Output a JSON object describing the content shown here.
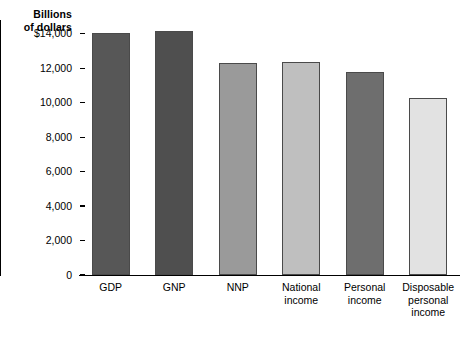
{
  "chart_data": {
    "type": "bar",
    "title": "",
    "subtitle": "",
    "ylabel": "Billions of dollars",
    "xlabel": "",
    "categories": [
      "GDP",
      "GNP",
      "NNP",
      "National income",
      "Personal income",
      "Disposable personal income"
    ],
    "category_lines": [
      [
        "GDP"
      ],
      [
        "GNP"
      ],
      [
        "NNP"
      ],
      [
        "National",
        "income"
      ],
      [
        "Personal",
        "income"
      ],
      [
        "Disposable",
        "personal",
        "income"
      ]
    ],
    "values": [
      14060,
      14150,
      12300,
      12350,
      11800,
      10300
    ],
    "bar_colors": [
      "#575757",
      "#4f4f4f",
      "#9a9a9a",
      "#bfbfbf",
      "#6e6e6e",
      "#e2e2e2"
    ],
    "ylim": [
      0,
      14800
    ],
    "ytick_values": [
      0,
      2000,
      4000,
      6000,
      8000,
      10000,
      12000,
      14000
    ],
    "ytick_labels": [
      "0",
      "2,000",
      "4,000",
      "6,000",
      "8,000",
      "10,000",
      "12,000",
      "$14,000"
    ],
    "grid": false,
    "legend": "none"
  },
  "axis_title": {
    "line1": "Billions",
    "line2": "of dollars"
  },
  "colors": {
    "axis": "#000000",
    "background": "#ffffff",
    "bar_stroke": "#4a4a4a"
  }
}
